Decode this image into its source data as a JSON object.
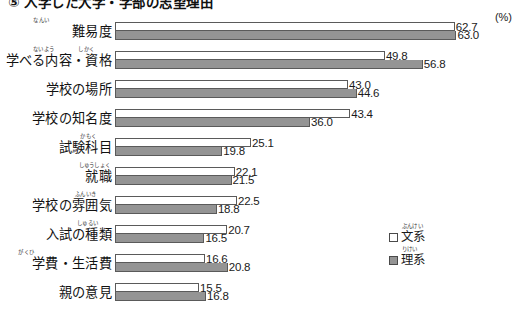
{
  "chart_data": {
    "type": "bar",
    "title": "⑤ 入学した大学・学部の志望理由",
    "unit_label": "(%)",
    "orientation": "horizontal-grouped",
    "xlabel": "",
    "ylabel": "",
    "xlim": [
      0,
      70
    ],
    "grid": false,
    "legend_position": "right-bottom",
    "categories": [
      "難易度",
      "学べる内容・資格",
      "学校の場所",
      "学校の知名度",
      "試験科目",
      "就職",
      "学校の雰囲気",
      "入試の種類",
      "学費・生活費",
      "親の意見"
    ],
    "category_ruby": [
      [
        {
          "text": "なんい",
          "offset": 63
        }
      ],
      [
        {
          "text": "ないよう",
          "offset": 58
        },
        {
          "text": "しかく",
          "offset": 18
        }
      ],
      [],
      [],
      [
        {
          "text": "かもく",
          "offset": 16
        }
      ],
      [
        {
          "text": "しゅうしょく",
          "offset": 2
        }
      ],
      [
        {
          "text": "ふんいき",
          "offset": 16
        }
      ],
      [
        {
          "text": "しゅるい",
          "offset": 14
        }
      ],
      [
        {
          "text": "がくひ",
          "offset": 78
        }
      ],
      []
    ],
    "series": [
      {
        "name": "文系",
        "name_ruby": "ぶんけい",
        "color": "#ffffff",
        "values": [
          62.7,
          49.8,
          43.0,
          43.4,
          25.1,
          22.1,
          22.5,
          20.7,
          16.6,
          15.5
        ]
      },
      {
        "name": "理系",
        "name_ruby": "りけい",
        "color": "#949494",
        "values": [
          63.0,
          56.8,
          44.6,
          36.0,
          19.8,
          21.5,
          18.8,
          16.5,
          20.8,
          16.8
        ]
      }
    ]
  }
}
